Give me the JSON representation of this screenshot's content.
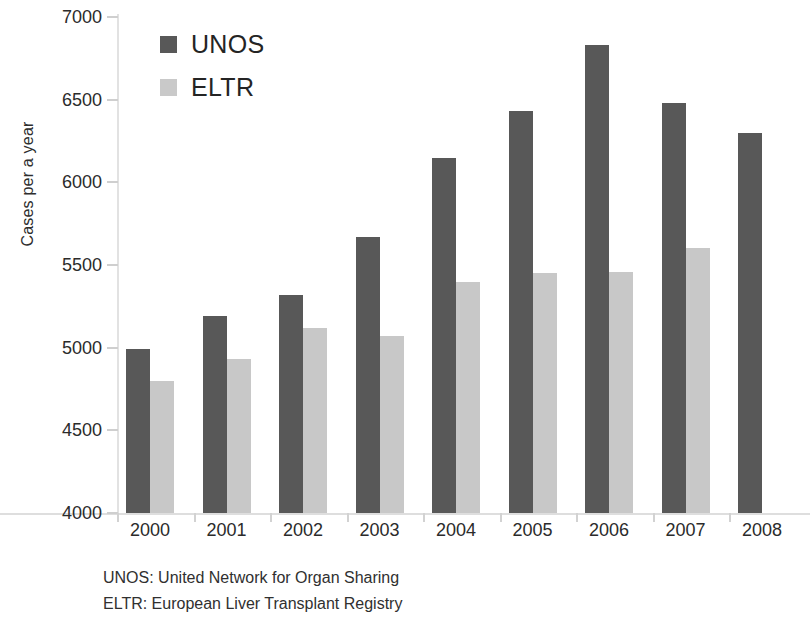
{
  "chart_data": {
    "type": "bar",
    "title": "",
    "xlabel": "",
    "ylabel": "Cases per a year",
    "ylim": [
      4000,
      7000
    ],
    "ytick_step": 500,
    "yticks": [
      4000,
      4500,
      5000,
      5500,
      6000,
      6500,
      7000
    ],
    "grid": false,
    "legend_position": "top-left",
    "categories": [
      "2000",
      "2001",
      "2002",
      "2003",
      "2004",
      "2005",
      "2006",
      "2007",
      "2008"
    ],
    "series": [
      {
        "name": "UNOS",
        "color": "#585858",
        "values": [
          4990,
          5190,
          5320,
          5670,
          6150,
          6430,
          6830,
          6480,
          6300
        ]
      },
      {
        "name": "ELTR",
        "color": "#c8c8c8",
        "values": [
          4800,
          4930,
          5120,
          5070,
          5400,
          5450,
          5460,
          5600,
          null
        ]
      }
    ]
  },
  "legend": [
    {
      "label": "UNOS",
      "swatch": "unos"
    },
    {
      "label": "ELTR",
      "swatch": "eltr"
    }
  ],
  "footnotes": [
    "UNOS:  United Network for Organ Sharing",
    "ELTR: European Liver Transplant Registry"
  ],
  "colors": {
    "unos": "#585858",
    "eltr": "#c8c8c8",
    "axis": "#dedede",
    "text": "#2b2b2b",
    "background": "#ffffff"
  }
}
